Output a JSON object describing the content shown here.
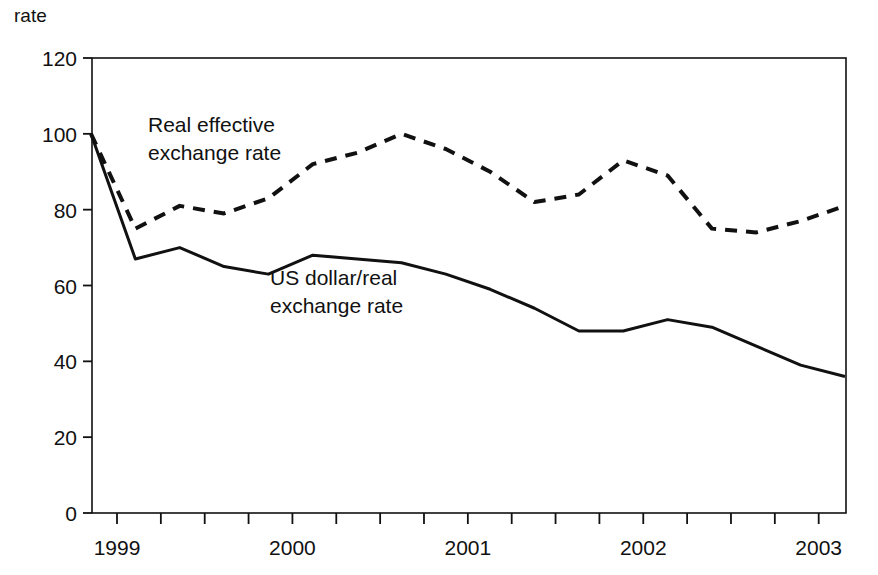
{
  "chart_data": {
    "type": "line",
    "title": "",
    "subtitle": "",
    "ylabel": "rate",
    "xlabel": "",
    "ylim": [
      0,
      120
    ],
    "yticks": [
      0,
      20,
      40,
      60,
      80,
      100,
      120
    ],
    "ytick_labels": [
      "0",
      "20",
      "40",
      "60",
      "80",
      "100",
      "120"
    ],
    "xtick_labels": [
      "1999",
      "2000",
      "2001",
      "2002",
      "2003"
    ],
    "x_minor_ticks_per_label": 4,
    "x_tick_count": 18,
    "grid": false,
    "legend_position": "inline-annotation",
    "x": [
      "1998Q4",
      "1999Q1",
      "1999Q2",
      "1999Q3",
      "1999Q4",
      "2000Q1",
      "2000Q2",
      "2000Q3",
      "2000Q4",
      "2001Q1",
      "2001Q2",
      "2001Q3",
      "2001Q4",
      "2002Q1",
      "2002Q2",
      "2002Q3",
      "2002Q4",
      "2003Q1"
    ],
    "series": [
      {
        "name": "Real effective exchange rate",
        "style": "dashed",
        "color": "#111111",
        "values": [
          100,
          75,
          81,
          79,
          83,
          92,
          95,
          100,
          96,
          90,
          82,
          84,
          93,
          89,
          75,
          74,
          77,
          81
        ]
      },
      {
        "name": "US dollar/real exchange rate",
        "style": "solid",
        "color": "#111111",
        "values": [
          100,
          67,
          70,
          65,
          63,
          68,
          67,
          66,
          63,
          59,
          54,
          48,
          48,
          51,
          49,
          44,
          39,
          36
        ]
      }
    ],
    "annotations": [
      {
        "name": "real-effective-exchange-rate-label",
        "lines": [
          "Real effective",
          "exchange rate"
        ],
        "x_px": 148,
        "y_px": 132
      },
      {
        "name": "us-dollar-real-exchange-rate-label",
        "lines": [
          "US dollar/real",
          "exchange rate"
        ],
        "x_px": 270,
        "y_px": 285
      }
    ]
  },
  "axis": {
    "y_axis_title": "rate",
    "y_tick_labels": [
      "120",
      "100",
      "80",
      "60",
      "40",
      "20",
      "0"
    ],
    "x_tick_labels": [
      "1999",
      "2000",
      "2001",
      "2002",
      "2003"
    ]
  },
  "colors": {
    "line": "#111111",
    "axis": "#111111",
    "background": "#ffffff"
  }
}
